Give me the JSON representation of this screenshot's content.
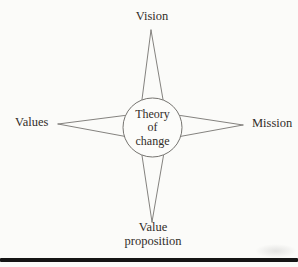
{
  "diagram": {
    "center": {
      "line1": "Theory",
      "line2": "of",
      "line3": "change"
    },
    "nodes": {
      "top": {
        "label": "Vision"
      },
      "right": {
        "label": "Mission"
      },
      "left": {
        "label": "Values"
      },
      "bottom": {
        "label": "Value proposition"
      }
    },
    "colors": {
      "line": "#767470",
      "text": "#322d29",
      "circle_fill": "#fcfcfa",
      "bottom_rule": "#151515",
      "background": "#fbfbf9"
    }
  }
}
